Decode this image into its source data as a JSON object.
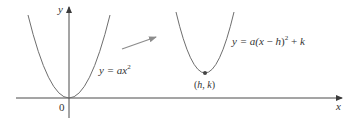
{
  "diagram": {
    "axes": {
      "x_label": "x",
      "y_label": "y",
      "origin_label": "0"
    },
    "curves": [
      {
        "id": "base-parabola",
        "equation_parts": [
          "y = a",
          "x",
          "2"
        ],
        "label": "y = ax²",
        "vertex": "0"
      },
      {
        "id": "shifted-parabola",
        "label": "y = a(x − h)² + k",
        "vertex_label": "(h, k)"
      }
    ],
    "arrow": {
      "meaning": "translation",
      "color": "#8c8c8c"
    },
    "colors": {
      "axis": "#4a4a4a",
      "curve": "#6e6e6e",
      "text": "#333333",
      "arrow": "#8c8c8c",
      "background": "#ffffff"
    }
  },
  "labels": {
    "y_axis": "y",
    "x_axis": "x",
    "origin": "0",
    "eq1_prefix": "y = a",
    "eq1_var": "x",
    "eq1_exp": "2",
    "eq2_prefix": "y = a(",
    "eq2_x": "x",
    "eq2_minus": " − ",
    "eq2_h": "h",
    "eq2_close": ")",
    "eq2_exp": "2",
    "eq2_plus": " + ",
    "eq2_k": "k",
    "vertex_open": "(",
    "vertex_h": "h",
    "vertex_comma": ", ",
    "vertex_k": "k",
    "vertex_close": ")"
  }
}
